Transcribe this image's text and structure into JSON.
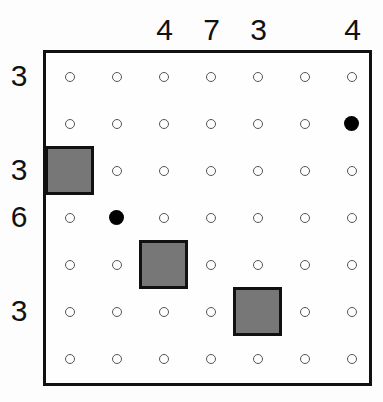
{
  "puzzle": {
    "rows": 7,
    "cols": 7,
    "column_clues": [
      "",
      "",
      "4",
      "7",
      "3",
      "",
      "4"
    ],
    "row_clues": [
      "3",
      "",
      "3",
      "6",
      "",
      "3",
      ""
    ],
    "blocks": [
      [
        2,
        0
      ],
      [
        4,
        2
      ],
      [
        5,
        4
      ]
    ],
    "filled_dots": [
      [
        1,
        6
      ],
      [
        3,
        1
      ]
    ],
    "colors": {
      "block": "#777777",
      "border": "#111111",
      "dot": "#000000"
    }
  }
}
